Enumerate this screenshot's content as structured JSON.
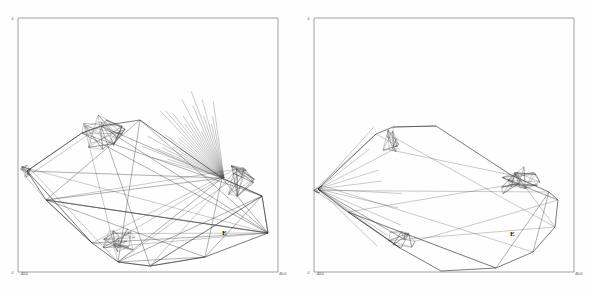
{
  "figure": {
    "background_color": "#fefefe",
    "frame_color": "#8a8a8a",
    "line_color": "#2b2b2b",
    "width": 592,
    "height": 296
  },
  "panels": [
    {
      "id": "left",
      "name": "dense-triangulated-mesh",
      "labels": {
        "top_left": "4",
        "bottom_left_corner": "0",
        "bottom_left_value": "-40.0",
        "bottom_right_value": "40.0",
        "point_label": "E"
      }
    },
    {
      "id": "right",
      "name": "sparse-hull-mesh",
      "labels": {
        "top_left": "4",
        "bottom_left_corner": "0",
        "bottom_left_value": "-40.0",
        "bottom_right_value": "40.0",
        "point_label": "E"
      }
    }
  ],
  "chart_data": {
    "type": "line",
    "xlabel": "",
    "ylabel": "",
    "grid": false,
    "legend": null,
    "panels": [
      {
        "name": "dense-triangulated-mesh",
        "description": "Dense Delaunay-style triangulated wireframe of an elongated faceted solid spanning the lower two-thirds of the frame, with heavy internal edge fans radiating from the right-hand vertex cluster.",
        "frame": {
          "x0": 18,
          "y0": 18,
          "x1": 278,
          "y1": 272
        },
        "hull": [
          [
            27,
            171
          ],
          [
            82,
            133
          ],
          [
            101,
            126
          ],
          [
            140,
            120
          ],
          [
            222,
            178
          ],
          [
            262,
            196
          ],
          [
            268,
            233
          ],
          [
            205,
            257
          ],
          [
            150,
            266
          ],
          [
            118,
            262
          ],
          [
            92,
            243
          ],
          [
            46,
            200
          ]
        ],
        "vertex_clusters": [
          {
            "cx": 104,
            "cy": 131,
            "r": 26,
            "density": "high"
          },
          {
            "cx": 233,
            "cy": 180,
            "r": 22,
            "density": "high"
          },
          {
            "cx": 119,
            "cy": 243,
            "r": 20,
            "density": "high"
          },
          {
            "cx": 27,
            "cy": 171,
            "r": 8,
            "density": "medium"
          }
        ],
        "fan_origin": [
          224,
          178
        ],
        "fan_spread_deg": [
          196,
          262
        ],
        "fan_count": 26,
        "label_point": {
          "text": "E",
          "x": 222,
          "y": 235
        }
      },
      {
        "name": "sparse-hull-mesh",
        "description": "Sparse convex-hull outline of the same solid with mesh detail retained only at the vertex clusters; large interior left empty.",
        "frame": {
          "x0": 18,
          "y0": 18,
          "x1": 278,
          "y1": 272
        },
        "hull": [
          [
            22,
            189
          ],
          [
            80,
            134
          ],
          [
            97,
            127
          ],
          [
            140,
            126
          ],
          [
            215,
            175
          ],
          [
            253,
            192
          ],
          [
            262,
            200
          ],
          [
            259,
            227
          ],
          [
            237,
            252
          ],
          [
            200,
            268
          ],
          [
            145,
            271
          ],
          [
            104,
            248
          ],
          [
            52,
            212
          ]
        ],
        "vertex_clusters": [
          {
            "cx": 94,
            "cy": 140,
            "r": 17,
            "density": "medium"
          },
          {
            "cx": 222,
            "cy": 183,
            "r": 22,
            "density": "high"
          },
          {
            "cx": 105,
            "cy": 240,
            "r": 16,
            "density": "medium"
          },
          {
            "cx": 22,
            "cy": 189,
            "r": 6,
            "density": "low"
          }
        ],
        "fan_origin": [
          22,
          189
        ],
        "fan_spread_deg": [
          312,
          44
        ],
        "fan_count": 9,
        "label_point": {
          "text": "E",
          "x": 214,
          "y": 236
        }
      }
    ]
  }
}
